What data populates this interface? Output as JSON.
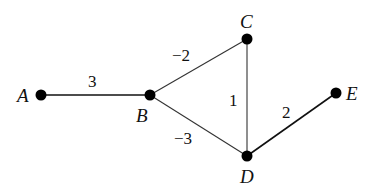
{
  "diagram": {
    "type": "weighted-graph",
    "nodes": [
      {
        "id": "A",
        "label": "A",
        "x": 41,
        "y": 95
      },
      {
        "id": "B",
        "label": "B",
        "x": 150,
        "y": 95
      },
      {
        "id": "C",
        "label": "C",
        "x": 247,
        "y": 39
      },
      {
        "id": "D",
        "label": "D",
        "x": 247,
        "y": 156
      },
      {
        "id": "E",
        "label": "E",
        "x": 336,
        "y": 93
      }
    ],
    "edges": [
      {
        "from": "A",
        "to": "B",
        "weight": "3"
      },
      {
        "from": "B",
        "to": "C",
        "weight": "−2"
      },
      {
        "from": "B",
        "to": "D",
        "weight": "−3"
      },
      {
        "from": "C",
        "to": "D",
        "weight": "1"
      },
      {
        "from": "D",
        "to": "E",
        "weight": "2"
      }
    ],
    "colors": {
      "edge": "#222222",
      "node": "#000000",
      "background": "#ffffff"
    }
  }
}
